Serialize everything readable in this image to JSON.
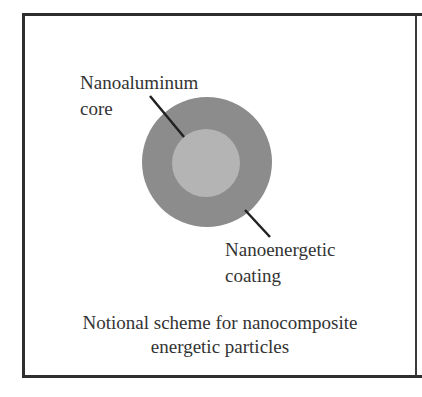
{
  "figure": {
    "labels": {
      "core": [
        "Nanoaluminum",
        "core"
      ],
      "coating": [
        "Nanoenergetic",
        "coating"
      ]
    },
    "caption": [
      "Notional scheme for nanocomposite",
      "energetic particles"
    ],
    "colors": {
      "frame": "#2e2e2e",
      "outer_coating": "#8c8c8c",
      "inner_core": "#b4b4b4",
      "leader_line": "#222222",
      "text": "#333333"
    }
  }
}
